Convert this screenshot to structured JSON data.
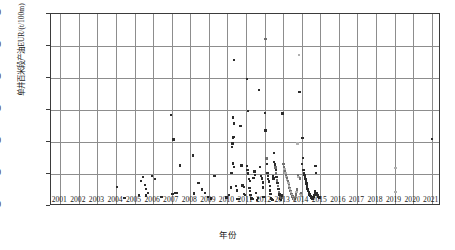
{
  "chart_data": {
    "type": "scatter",
    "title": "",
    "xlabel": "年份",
    "ylabel": "单井百米段产油EUR/(t/100m)",
    "xlim": [
      2000.5,
      2021.5
    ],
    "ylim": [
      0,
      3000
    ],
    "ytick_labels": [
      "0",
      "500",
      "1000",
      "1500",
      "2000",
      "2500",
      "3000"
    ],
    "ytick_values": [
      0,
      500,
      1000,
      1500,
      2000,
      2500,
      3000
    ],
    "xtick_labels": [
      "2001",
      "2002",
      "2003",
      "2004",
      "2005",
      "2006",
      "2007",
      "2008",
      "2009",
      "2010",
      "2011",
      "2012",
      "2013",
      "2014",
      "2015",
      "2016",
      "2017",
      "2018",
      "2019",
      "2020",
      "2021"
    ],
    "xtick_values": [
      2001,
      2002,
      2003,
      2004,
      2005,
      2006,
      2007,
      2008,
      2009,
      2010,
      2011,
      2012,
      2013,
      2014,
      2015,
      2016,
      2017,
      2018,
      2019,
      2020,
      2021
    ],
    "grid": true,
    "legend": "none",
    "marker_colors": {
      "dark": "#2b2b2b",
      "mid": "#6f6f6f",
      "light": "#b0b0b0"
    },
    "points": [
      [
        2004.05,
        295,
        "dark"
      ],
      [
        2004.45,
        122,
        "dark"
      ],
      [
        2005.25,
        170,
        "dark"
      ],
      [
        2005.35,
        395,
        "dark"
      ],
      [
        2005.45,
        455,
        "dark"
      ],
      [
        2005.55,
        330,
        "dark"
      ],
      [
        2005.6,
        262,
        "dark"
      ],
      [
        2005.72,
        205,
        "dark"
      ],
      [
        2005.95,
        465,
        "dark"
      ],
      [
        2005.62,
        165,
        "dark"
      ],
      [
        2006.1,
        420,
        "dark"
      ],
      [
        2006.45,
        140,
        "dark"
      ],
      [
        2006.95,
        1420,
        "dark"
      ],
      [
        2007.1,
        1042,
        "dark"
      ],
      [
        2007.05,
        188,
        "dark"
      ],
      [
        2007.2,
        200,
        "dark"
      ],
      [
        2007.3,
        205,
        "dark"
      ],
      [
        2007.45,
        630,
        "dark"
      ],
      [
        2008.15,
        792,
        "dark"
      ],
      [
        2008.2,
        196,
        "dark"
      ],
      [
        2008.45,
        355,
        "dark"
      ],
      [
        2008.62,
        255,
        "dark"
      ],
      [
        2008.8,
        205,
        "dark"
      ],
      [
        2008.95,
        140,
        "dark"
      ],
      [
        2009.12,
        118,
        "dark"
      ],
      [
        2009.3,
        465,
        "dark"
      ],
      [
        2009.95,
        133,
        "dark"
      ],
      [
        2010.35,
        2278,
        "dark"
      ],
      [
        2010.3,
        1380,
        "dark"
      ],
      [
        2010.35,
        1288,
        "dark"
      ],
      [
        2010.32,
        1080,
        "dark"
      ],
      [
        2010.3,
        1062,
        "dark"
      ],
      [
        2010.28,
        975,
        "dark"
      ],
      [
        2010.25,
        918,
        "dark"
      ],
      [
        2010.3,
        665,
        "dark"
      ],
      [
        2010.35,
        612,
        "dark"
      ],
      [
        2010.22,
        515,
        "dark"
      ],
      [
        2010.18,
        290,
        "dark"
      ],
      [
        2010.1,
        170,
        "dark"
      ],
      [
        2010.45,
        308,
        "dark"
      ],
      [
        2010.5,
        240,
        "dark"
      ],
      [
        2010.55,
        105,
        "dark"
      ],
      [
        2010.62,
        112,
        "dark"
      ],
      [
        2010.7,
        1248,
        "dark"
      ],
      [
        2010.75,
        630,
        "dark"
      ],
      [
        2010.82,
        320,
        "dark"
      ],
      [
        2010.88,
        300,
        "dark"
      ],
      [
        2010.9,
        190,
        "dark"
      ],
      [
        2010.95,
        168,
        "dark"
      ],
      [
        2011.05,
        1985,
        "dark"
      ],
      [
        2011.1,
        1488,
        "dark"
      ],
      [
        2011.05,
        625,
        "dark"
      ],
      [
        2011.08,
        560,
        "dark"
      ],
      [
        2011.12,
        508,
        "dark"
      ],
      [
        2011.15,
        418,
        "dark"
      ],
      [
        2011.2,
        392,
        "dark"
      ],
      [
        2011.18,
        280,
        "dark"
      ],
      [
        2011.22,
        238,
        "dark"
      ],
      [
        2011.25,
        168,
        "dark"
      ],
      [
        2011.3,
        118,
        "dark"
      ],
      [
        2011.35,
        108,
        "dark"
      ],
      [
        2011.4,
        440,
        "dark"
      ],
      [
        2011.45,
        540,
        "dark"
      ],
      [
        2011.5,
        480,
        "dark"
      ],
      [
        2011.55,
        200,
        "dark"
      ],
      [
        2011.6,
        96,
        "dark"
      ],
      [
        2011.65,
        128,
        "dark"
      ],
      [
        2011.7,
        1812,
        "dark"
      ],
      [
        2011.75,
        610,
        "dark"
      ],
      [
        2011.8,
        470,
        "dark"
      ],
      [
        2011.85,
        432,
        "dark"
      ],
      [
        2011.9,
        365,
        "dark"
      ],
      [
        2011.92,
        290,
        "dark"
      ],
      [
        2011.95,
        142,
        "dark"
      ],
      [
        2012.05,
        2612,
        "mid"
      ],
      [
        2012.02,
        1452,
        "dark"
      ],
      [
        2012.05,
        1182,
        "dark"
      ],
      [
        2012.1,
        740,
        "mid"
      ],
      [
        2012.12,
        655,
        "dark"
      ],
      [
        2012.15,
        520,
        "dark"
      ],
      [
        2012.18,
        468,
        "dark"
      ],
      [
        2012.2,
        422,
        "dark"
      ],
      [
        2012.25,
        380,
        "dark"
      ],
      [
        2012.28,
        308,
        "dark"
      ],
      [
        2012.3,
        245,
        "dark"
      ],
      [
        2012.32,
        188,
        "dark"
      ],
      [
        2012.35,
        122,
        "dark"
      ],
      [
        2012.38,
        108,
        "dark"
      ],
      [
        2012.42,
        95,
        "dark"
      ],
      [
        2012.45,
        470,
        "dark"
      ],
      [
        2012.48,
        432,
        "dark"
      ],
      [
        2012.5,
        830,
        "dark"
      ],
      [
        2012.52,
        690,
        "dark"
      ],
      [
        2012.55,
        648,
        "dark"
      ],
      [
        2012.58,
        600,
        "mid"
      ],
      [
        2012.6,
        560,
        "dark"
      ],
      [
        2012.62,
        505,
        "mid"
      ],
      [
        2012.65,
        458,
        "dark"
      ],
      [
        2012.68,
        400,
        "mid"
      ],
      [
        2012.7,
        355,
        "dark"
      ],
      [
        2012.72,
        308,
        "mid"
      ],
      [
        2012.75,
        262,
        "dark"
      ],
      [
        2012.78,
        215,
        "mid"
      ],
      [
        2012.8,
        178,
        "dark"
      ],
      [
        2012.82,
        138,
        "mid"
      ],
      [
        2012.85,
        112,
        "dark"
      ],
      [
        2012.88,
        100,
        "mid"
      ],
      [
        2012.9,
        95,
        "dark"
      ],
      [
        2012.92,
        128,
        "mid"
      ],
      [
        2012.95,
        162,
        "dark"
      ],
      [
        2012.97,
        1448,
        "dark"
      ],
      [
        2013.02,
        660,
        "mid"
      ],
      [
        2013.05,
        612,
        "mid"
      ],
      [
        2013.08,
        575,
        "light"
      ],
      [
        2013.1,
        548,
        "mid"
      ],
      [
        2013.12,
        510,
        "light"
      ],
      [
        2013.15,
        478,
        "mid"
      ],
      [
        2013.18,
        452,
        "light"
      ],
      [
        2013.2,
        428,
        "mid"
      ],
      [
        2013.22,
        405,
        "light"
      ],
      [
        2013.25,
        382,
        "mid"
      ],
      [
        2013.28,
        355,
        "light"
      ],
      [
        2013.3,
        330,
        "mid"
      ],
      [
        2013.32,
        305,
        "light"
      ],
      [
        2013.35,
        282,
        "mid"
      ],
      [
        2013.38,
        258,
        "light"
      ],
      [
        2013.4,
        235,
        "mid"
      ],
      [
        2013.42,
        212,
        "light"
      ],
      [
        2013.45,
        190,
        "mid"
      ],
      [
        2013.48,
        168,
        "light"
      ],
      [
        2013.5,
        150,
        "mid"
      ],
      [
        2013.52,
        132,
        "light"
      ],
      [
        2013.55,
        118,
        "mid"
      ],
      [
        2013.58,
        105,
        "light"
      ],
      [
        2013.6,
        98,
        "mid"
      ],
      [
        2013.62,
        92,
        "light"
      ],
      [
        2013.65,
        112,
        "mid"
      ],
      [
        2013.68,
        140,
        "light"
      ],
      [
        2013.7,
        178,
        "mid"
      ],
      [
        2013.72,
        215,
        "light"
      ],
      [
        2013.75,
        255,
        "mid"
      ],
      [
        2013.78,
        975,
        "light"
      ],
      [
        2013.8,
        480,
        "mid"
      ],
      [
        2013.82,
        455,
        "light"
      ],
      [
        2013.85,
        2358,
        "light"
      ],
      [
        2013.88,
        1782,
        "dark"
      ],
      [
        2013.9,
        430,
        "mid"
      ],
      [
        2013.92,
        188,
        "light"
      ],
      [
        2013.95,
        205,
        "mid"
      ],
      [
        2013.97,
        162,
        "light"
      ],
      [
        2014.02,
        655,
        "dark"
      ],
      [
        2014.05,
        1062,
        "dark"
      ],
      [
        2014.08,
        752,
        "dark"
      ],
      [
        2014.1,
        560,
        "dark"
      ],
      [
        2014.12,
        510,
        "dark"
      ],
      [
        2014.15,
        480,
        "dark"
      ],
      [
        2014.18,
        452,
        "dark"
      ],
      [
        2014.2,
        425,
        "dark"
      ],
      [
        2014.22,
        398,
        "dark"
      ],
      [
        2014.25,
        352,
        "dark"
      ],
      [
        2014.28,
        318,
        "dark"
      ],
      [
        2014.3,
        285,
        "dark"
      ],
      [
        2014.32,
        262,
        "dark"
      ],
      [
        2014.35,
        240,
        "dark"
      ],
      [
        2014.38,
        218,
        "dark"
      ],
      [
        2014.4,
        198,
        "dark"
      ],
      [
        2014.42,
        182,
        "dark"
      ],
      [
        2014.45,
        168,
        "dark"
      ],
      [
        2014.48,
        155,
        "dark"
      ],
      [
        2014.5,
        142,
        "dark"
      ],
      [
        2014.52,
        132,
        "dark"
      ],
      [
        2014.55,
        120,
        "dark"
      ],
      [
        2014.58,
        112,
        "dark"
      ],
      [
        2014.6,
        105,
        "dark"
      ],
      [
        2014.62,
        128,
        "dark"
      ],
      [
        2014.65,
        148,
        "dark"
      ],
      [
        2014.68,
        175,
        "dark"
      ],
      [
        2014.7,
        200,
        "dark"
      ],
      [
        2014.72,
        228,
        "dark"
      ],
      [
        2014.75,
        625,
        "dark"
      ],
      [
        2014.78,
        520,
        "dark"
      ],
      [
        2014.8,
        195,
        "dark"
      ],
      [
        2014.85,
        168,
        "dark"
      ],
      [
        2014.88,
        150,
        "dark"
      ],
      [
        2014.92,
        138,
        "dark"
      ],
      [
        2014.95,
        130,
        "dark"
      ],
      [
        2019.05,
        598,
        "light"
      ],
      [
        2019.05,
        215,
        "light"
      ],
      [
        2021.0,
        1048,
        "dark"
      ]
    ]
  }
}
